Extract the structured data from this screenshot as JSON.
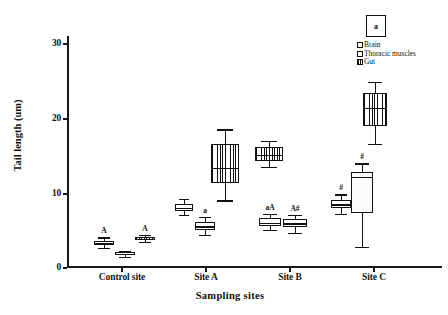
{
  "chart": {
    "type": "box",
    "y_axis_title": "Tail length (um)",
    "x_axis_title": "Sampling sites",
    "y_ticks": [
      "0",
      "10",
      "20",
      "30"
    ],
    "x_categories": [
      "Control site",
      "Site A",
      "Site B",
      "Site C"
    ],
    "annotation_box": "a"
  },
  "legend": {
    "items": [
      {
        "label": "Brain",
        "swatch": "white-square"
      },
      {
        "label": "Thoracic muscles",
        "swatch": "white-square"
      },
      {
        "label": "Gut",
        "swatch": "vertical-hatch-square"
      }
    ]
  },
  "chart_data": {
    "type": "box",
    "title": "",
    "xlabel": "Sampling sites",
    "ylabel": "Tail length (um)",
    "ylim": [
      0,
      32
    ],
    "yticks": [
      0,
      10,
      20,
      30
    ],
    "grid": false,
    "legend_position": "top-right",
    "categories": [
      "Control site",
      "Site A",
      "Site B",
      "Site C"
    ],
    "series": [
      {
        "name": "Brain",
        "fill": "white",
        "boxes": [
          {
            "category": "Control site",
            "whisker_low": 2.6,
            "q1": 3.0,
            "median": 3.2,
            "q3": 3.5,
            "whisker_high": 4.0,
            "label": "A"
          },
          {
            "category": "Site A",
            "whisker_low": 7.0,
            "q1": 7.6,
            "median": 8.0,
            "q3": 8.5,
            "whisker_high": 9.2,
            "label": ""
          },
          {
            "category": "Site B",
            "whisker_low": 5.0,
            "q1": 5.5,
            "median": 6.0,
            "q3": 6.6,
            "whisker_high": 7.2,
            "label": "aA"
          },
          {
            "category": "Site C",
            "whisker_low": 7.2,
            "q1": 8.0,
            "median": 8.5,
            "q3": 9.0,
            "whisker_high": 9.8,
            "label": "#"
          }
        ]
      },
      {
        "name": "Thoracic muscles",
        "fill": "white",
        "boxes": [
          {
            "category": "Control site",
            "whisker_low": 1.4,
            "q1": 1.6,
            "median": 1.8,
            "q3": 2.0,
            "whisker_high": 2.2,
            "label": ""
          },
          {
            "category": "Site A",
            "whisker_low": 4.3,
            "q1": 5.0,
            "median": 5.5,
            "q3": 6.1,
            "whisker_high": 6.8,
            "label": "a"
          },
          {
            "category": "Site B",
            "whisker_low": 4.6,
            "q1": 5.4,
            "median": 5.9,
            "q3": 6.5,
            "whisker_high": 7.0,
            "label": "A#"
          },
          {
            "category": "Site C",
            "whisker_low": 2.7,
            "q1": 7.3,
            "median": 12.2,
            "q3": 12.9,
            "whisker_high": 14.0,
            "label": "#"
          }
        ]
      },
      {
        "name": "Gut",
        "fill": "vertical-hatch",
        "boxes": [
          {
            "category": "Control site",
            "whisker_low": 3.4,
            "q1": 3.6,
            "median": 3.8,
            "q3": 4.1,
            "whisker_high": 4.3,
            "label": "A"
          },
          {
            "category": "Site A",
            "whisker_low": 9.0,
            "q1": 11.3,
            "median": 13.4,
            "q3": 16.6,
            "whisker_high": 18.6,
            "label": ""
          },
          {
            "category": "Site B",
            "whisker_low": 13.5,
            "q1": 14.3,
            "median": 15.2,
            "q3": 16.2,
            "whisker_high": 17.0,
            "label": ""
          },
          {
            "category": "Site C",
            "whisker_low": 16.6,
            "q1": 19.0,
            "median": 21.5,
            "q3": 23.5,
            "whisker_high": 25.0,
            "label": ""
          }
        ]
      }
    ]
  }
}
